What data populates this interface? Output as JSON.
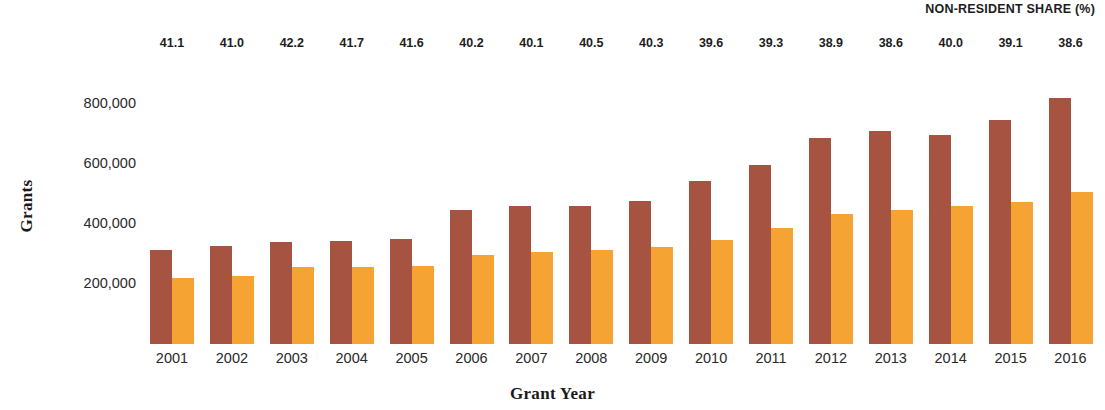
{
  "chart_data": {
    "type": "bar",
    "title": "",
    "annotation_title": "NON-RESIDENT SHARE (%)",
    "xlabel": "Grant Year",
    "ylabel": "Grants",
    "categories": [
      "2001",
      "2002",
      "2003",
      "2004",
      "2005",
      "2006",
      "2007",
      "2008",
      "2009",
      "2010",
      "2011",
      "2012",
      "2013",
      "2014",
      "2015",
      "2016"
    ],
    "ylim": [
      0,
      860000
    ],
    "yticks": [
      200000,
      400000,
      600000,
      800000
    ],
    "ytick_labels": [
      "200,000",
      "400,000",
      "600,000",
      "800,000"
    ],
    "grid": false,
    "legend": "none",
    "series": [
      {
        "name": "Total grants",
        "color": "#a65341",
        "values": [
          313000,
          327000,
          340000,
          343000,
          350000,
          447000,
          460000,
          460000,
          477000,
          543000,
          597000,
          687000,
          710000,
          697000,
          747000,
          820000
        ]
      },
      {
        "name": "Non-resident grants",
        "color": "#f5a433",
        "values": [
          220000,
          227000,
          257000,
          257000,
          260000,
          297000,
          307000,
          313000,
          323000,
          347000,
          387000,
          433000,
          447000,
          460000,
          473000,
          507000
        ]
      }
    ],
    "annotations": {
      "label": "NON-RESIDENT SHARE (%)",
      "values": [
        "41.1",
        "41.0",
        "42.2",
        "41.7",
        "41.6",
        "40.2",
        "40.1",
        "40.5",
        "40.3",
        "39.6",
        "39.3",
        "38.9",
        "38.6",
        "40.0",
        "39.1",
        "38.6"
      ]
    },
    "layout": {
      "baseline_y": 344,
      "pixels_per_200k": 60,
      "group_left_start": 150,
      "group_pitch": 59.9,
      "bar_width": 22
    }
  }
}
